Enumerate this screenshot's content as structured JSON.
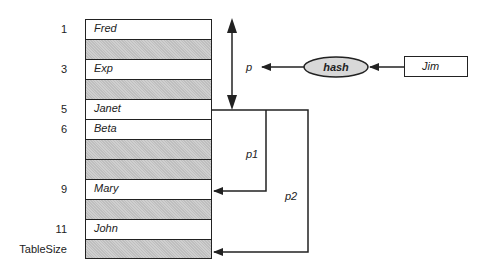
{
  "diagram": {
    "table": {
      "rows": [
        {
          "index": "1",
          "value": "Fred",
          "shaded": false
        },
        {
          "index": "",
          "value": "",
          "shaded": true
        },
        {
          "index": "3",
          "value": "Exp",
          "shaded": false
        },
        {
          "index": "",
          "value": "",
          "shaded": true
        },
        {
          "index": "5",
          "value": "Janet",
          "shaded": false
        },
        {
          "index": "6",
          "value": "Beta",
          "shaded": false
        },
        {
          "index": "",
          "value": "",
          "shaded": true
        },
        {
          "index": "",
          "value": "",
          "shaded": true
        },
        {
          "index": "9",
          "value": "Mary",
          "shaded": false
        },
        {
          "index": "",
          "value": "",
          "shaded": true
        },
        {
          "index": "11",
          "value": "John",
          "shaded": false
        },
        {
          "index": "TableSize",
          "value": "",
          "shaded": true
        }
      ]
    },
    "key_box": {
      "label": "Jim"
    },
    "hash_node": {
      "label": "hash"
    },
    "labels": {
      "p": "p",
      "p1": "p1",
      "p2": "p2"
    },
    "colors": {
      "stroke": "#222222",
      "shade": "#cfcfcf",
      "ellipse_fill": "#d8d8d8"
    }
  }
}
